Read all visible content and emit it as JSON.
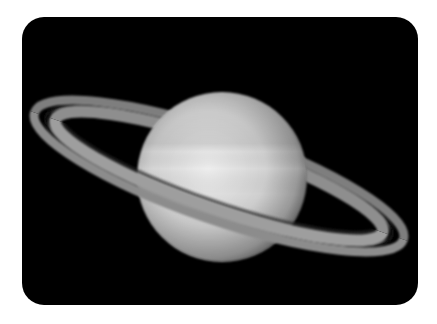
{
  "image": {
    "subject": "Saturn with rings",
    "background": "#000000",
    "page_background": "#ffffff",
    "colors": {
      "planet_light": "#e6e6e6",
      "planet_mid": "#bdbdbd",
      "planet_dark": "#6a6a6a",
      "ring_outer": "#8c8c8c",
      "ring_gap": "#1a1a1a",
      "ring_inner": "#9a9a9a"
    }
  }
}
